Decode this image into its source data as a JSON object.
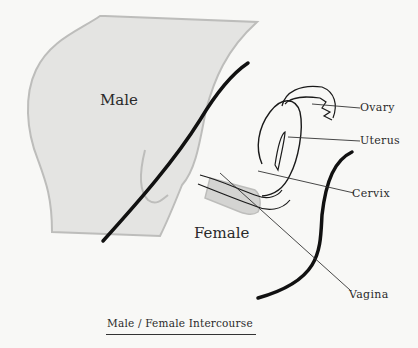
{
  "diagram": {
    "labels": {
      "male": "Male",
      "female": "Female",
      "ovary": "Ovary",
      "uterus": "Uterus",
      "cervix": "Cervix",
      "vagina": "Vagina"
    },
    "caption": "Male / Female Intercourse",
    "colors": {
      "background": "#f8f8f6",
      "male_fill": "#e4e4e2",
      "male_outline": "#bdbdbb",
      "female_outline": "#111111",
      "organ_line": "#1a1a1a",
      "text": "#2a2a2a"
    }
  }
}
